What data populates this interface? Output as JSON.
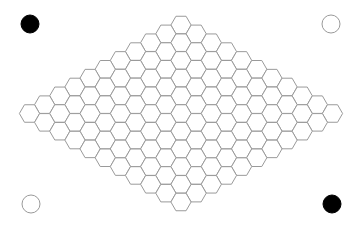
{
  "game": {
    "type": "hex",
    "board_size": 11,
    "cells": {
      "orientation": "flat-top",
      "side": 10.1,
      "origin": {
        "x": 181,
        "y": 25
      },
      "step_i": {
        "dx": -15.15,
        "dy": 8.85
      },
      "step_j": {
        "dx": 15.15,
        "dy": 8.85
      },
      "stroke_color": "#9a9a9a",
      "fill_color": "#ffffff"
    },
    "corner_stones": [
      {
        "position": "top-left",
        "color": "black",
        "cx": 30,
        "cy": 24,
        "r": 9,
        "fill": "#000000",
        "stroke": "#000000"
      },
      {
        "position": "top-right",
        "color": "white",
        "cx": 331,
        "cy": 24,
        "r": 9,
        "fill": "#ffffff",
        "stroke": "#9a9a9a"
      },
      {
        "position": "bottom-left",
        "color": "white",
        "cx": 31,
        "cy": 204,
        "r": 9,
        "fill": "#ffffff",
        "stroke": "#9a9a9a"
      },
      {
        "position": "bottom-right",
        "color": "black",
        "cx": 332,
        "cy": 204,
        "r": 9,
        "fill": "#000000",
        "stroke": "#000000"
      }
    ],
    "background_color": "#ffffff"
  }
}
